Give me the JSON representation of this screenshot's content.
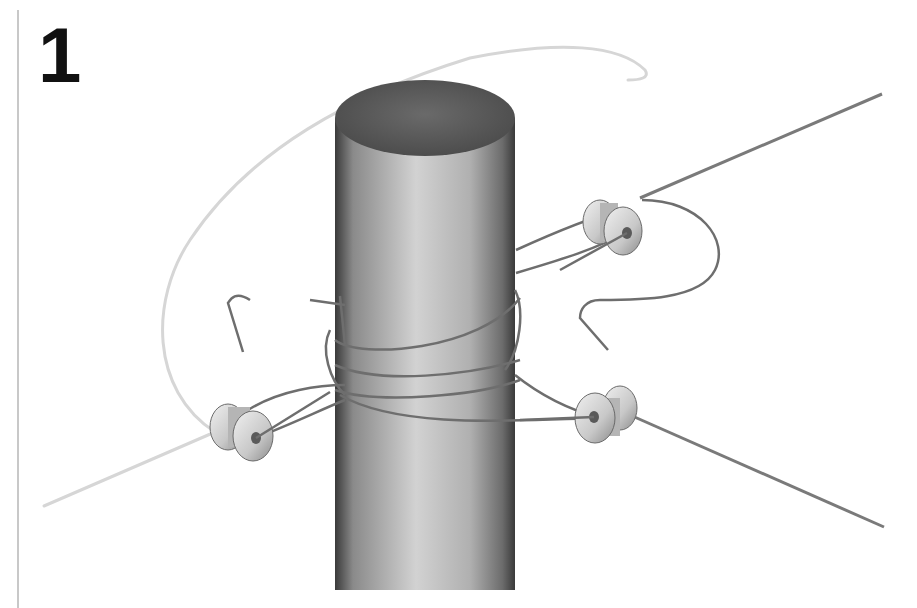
{
  "figure": {
    "step_number": "1"
  },
  "colors": {
    "post_top": "#5a5a5a",
    "post_side_light": "#c9c9c9",
    "post_side_dark": "#3f3f3f",
    "wire_dark": "#6e6e6e",
    "wire_light": "#dcdcdc",
    "insulator": "#d4d4d4",
    "frame_line": "#c8c8c8"
  }
}
